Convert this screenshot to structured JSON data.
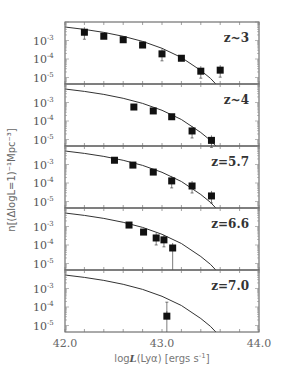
{
  "chart_data": {
    "type": "scatter",
    "layout": "5 vertically stacked panels sharing x-axis",
    "xlabel": "logL(Lya) [ergs s^-1]",
    "ylabel": "n[(ΔlogL=1)^-1 Mpc^-3]",
    "xlim": [
      42.0,
      44.0
    ],
    "xticks": [
      "42.0",
      "43.0",
      "44.0"
    ],
    "ylim_log10": [
      -5.35,
      -2.0
    ],
    "yticks": [
      "10^-3",
      "10^-4",
      "10^-5"
    ],
    "model_curve": {
      "description": "Schechter-like luminosity function, same curve in every panel",
      "points_logL_logn": [
        [
          42.0,
          -2.27
        ],
        [
          42.2,
          -2.4
        ],
        [
          42.4,
          -2.56
        ],
        [
          42.6,
          -2.77
        ],
        [
          42.8,
          -3.05
        ],
        [
          43.0,
          -3.42
        ],
        [
          43.2,
          -3.92
        ],
        [
          43.4,
          -4.62
        ],
        [
          43.5,
          -5.05
        ],
        [
          43.6,
          -5.6
        ]
      ]
    },
    "panels": [
      {
        "label": "z~3",
        "points": [
          {
            "logL": 42.2,
            "n": 0.0028,
            "err": true
          },
          {
            "logL": 42.4,
            "n": 0.0017,
            "err": false
          },
          {
            "logL": 42.6,
            "n": 0.0011,
            "err": false
          },
          {
            "logL": 42.8,
            "n": 0.00057,
            "err": false
          },
          {
            "logL": 43.0,
            "n": 0.00019,
            "err": true
          },
          {
            "logL": 43.2,
            "n": 0.00011,
            "err": false
          },
          {
            "logL": 43.4,
            "n": 2.2e-05,
            "err": true
          },
          {
            "logL": 43.6,
            "n": 2.5e-05,
            "err": true
          }
        ]
      },
      {
        "label": "z~4",
        "points": [
          {
            "logL": 42.71,
            "n": 0.00057,
            "err": false
          },
          {
            "logL": 42.91,
            "n": 0.00035,
            "err": false
          },
          {
            "logL": 43.1,
            "n": 0.00017,
            "err": false
          },
          {
            "logL": 43.31,
            "n": 2.9e-05,
            "err": true
          },
          {
            "logL": 43.51,
            "n": 9e-06,
            "err": true
          }
        ]
      },
      {
        "label": "z=5.7",
        "points": [
          {
            "logL": 42.51,
            "n": 0.0017,
            "err": false
          },
          {
            "logL": 42.7,
            "n": 0.00093,
            "err": false
          },
          {
            "logL": 42.91,
            "n": 0.00039,
            "err": false
          },
          {
            "logL": 43.1,
            "n": 0.00013,
            "err": true
          },
          {
            "logL": 43.31,
            "n": 6.9e-05,
            "err": true
          },
          {
            "logL": 43.51,
            "n": 2e-05,
            "err": true
          }
        ]
      },
      {
        "label": "z=6.6",
        "points": [
          {
            "logL": 42.66,
            "n": 0.0012,
            "err": false
          },
          {
            "logL": 42.81,
            "n": 0.0005,
            "err": false
          },
          {
            "logL": 42.94,
            "n": 0.00024,
            "err": true
          },
          {
            "logL": 43.02,
            "n": 0.00019,
            "err": true
          },
          {
            "logL": 43.11,
            "n": 6.9e-05,
            "err": "to-bottom"
          }
        ]
      },
      {
        "label": "z=7.0",
        "points": [
          {
            "logL": 43.05,
            "n": 3.2e-05,
            "err": "large"
          }
        ]
      }
    ]
  },
  "axes": {
    "xlabel_html_parts": {
      "pre": "log",
      "italic": "L",
      "post": "(Lyα) [ergs s",
      "sup": "-1",
      "end": "]"
    },
    "ylabel_text": "n[(ΔlogL=1)⁻¹Mpc⁻³]",
    "xticks": [
      "42.0",
      "43.0",
      "44.0"
    ]
  }
}
